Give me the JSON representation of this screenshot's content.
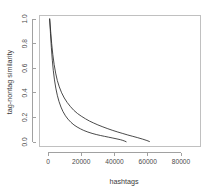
{
  "chart_data": {
    "type": "line",
    "title": "",
    "subtitle": "",
    "xlabel": "hashtags",
    "ylabel": "tag-nontag similarity",
    "xlim": [
      0,
      90000
    ],
    "ylim": [
      0.0,
      1.0
    ],
    "xticks": [
      0,
      20000,
      40000,
      60000,
      80000
    ],
    "xtick_labels": [
      "0",
      "20000",
      "40000",
      "60000",
      "80000"
    ],
    "yticks": [
      0.0,
      0.2,
      0.4,
      0.6,
      0.8,
      1.0
    ],
    "ytick_labels": [
      "0.0",
      "0.2",
      "0.4",
      "0.6",
      "0.8",
      "1.0"
    ],
    "grid": false,
    "legend": false,
    "legend_position": "none",
    "series": [
      {
        "name": "upper-decay-curve",
        "color": "#2b2b2b",
        "points": [
          [
            1000,
            1.0
          ],
          [
            1600,
            0.9
          ],
          [
            2200,
            0.8
          ],
          [
            2900,
            0.71
          ],
          [
            3700,
            0.63
          ],
          [
            4600,
            0.56
          ],
          [
            5600,
            0.5
          ],
          [
            6800,
            0.448
          ],
          [
            8200,
            0.4
          ],
          [
            9800,
            0.358
          ],
          [
            11500,
            0.322
          ],
          [
            13500,
            0.288
          ],
          [
            15500,
            0.258
          ],
          [
            17800,
            0.231
          ],
          [
            20000,
            0.21
          ],
          [
            22500,
            0.189
          ],
          [
            25000,
            0.17
          ],
          [
            27500,
            0.154
          ],
          [
            30000,
            0.139
          ],
          [
            33000,
            0.123
          ],
          [
            36000,
            0.108
          ],
          [
            39000,
            0.094
          ],
          [
            42000,
            0.081
          ],
          [
            45000,
            0.069
          ],
          [
            48000,
            0.057
          ],
          [
            51000,
            0.046
          ],
          [
            54000,
            0.035
          ],
          [
            57000,
            0.023
          ],
          [
            59500,
            0.012
          ],
          [
            61000,
            0.004
          ]
        ]
      },
      {
        "name": "lower-decay-curve",
        "color": "#2b2b2b",
        "points": [
          [
            1000,
            1.0
          ],
          [
            1500,
            0.88
          ],
          [
            2000,
            0.77
          ],
          [
            2600,
            0.665
          ],
          [
            3200,
            0.58
          ],
          [
            3900,
            0.505
          ],
          [
            4700,
            0.438
          ],
          [
            5600,
            0.38
          ],
          [
            6600,
            0.33
          ],
          [
            7800,
            0.284
          ],
          [
            9000,
            0.248
          ],
          [
            10500,
            0.213
          ],
          [
            12000,
            0.186
          ],
          [
            13800,
            0.16
          ],
          [
            15600,
            0.139
          ],
          [
            17500,
            0.122
          ],
          [
            19500,
            0.107
          ],
          [
            21500,
            0.094
          ],
          [
            24000,
            0.081
          ],
          [
            26500,
            0.07
          ],
          [
            29000,
            0.061
          ],
          [
            31500,
            0.053
          ],
          [
            34000,
            0.046
          ],
          [
            36500,
            0.039
          ],
          [
            39000,
            0.032
          ],
          [
            41500,
            0.025
          ],
          [
            43500,
            0.019
          ],
          [
            45000,
            0.013
          ],
          [
            46200,
            0.007
          ],
          [
            47000,
            0.002
          ]
        ]
      }
    ]
  }
}
